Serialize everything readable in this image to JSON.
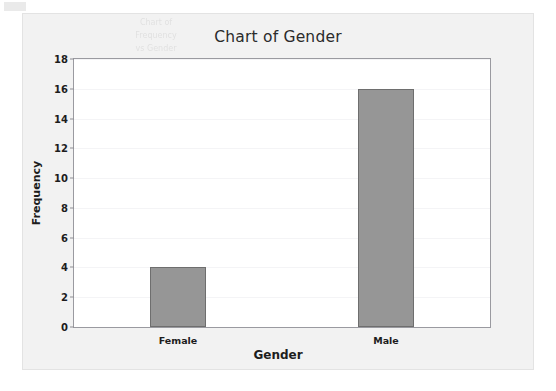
{
  "figure": {
    "scan_artifact_name": "scan-mark",
    "ghost_lines": [
      "Chart of",
      "Frequency",
      "vs Gender"
    ],
    "panel_background": "#f2f2f2",
    "plot_background": "#ffffff"
  },
  "chart_data": {
    "type": "bar",
    "title": "Chart of Gender",
    "xlabel": "Gender",
    "ylabel": "Frequency",
    "categories": [
      "Female",
      "Male"
    ],
    "values": [
      4,
      16
    ],
    "ylim": [
      0,
      18
    ],
    "yticks": [
      0,
      2,
      4,
      6,
      8,
      10,
      12,
      14,
      16,
      18
    ],
    "grid": true,
    "legend": "none",
    "bar_color": "#969696",
    "bar_edge_color": "#6e6e6e",
    "gridline_color": "#f4f4f6",
    "axis_color": "#9a9aa0",
    "text_color": "#1d1d1d",
    "title_color": "#2b2b2b"
  }
}
